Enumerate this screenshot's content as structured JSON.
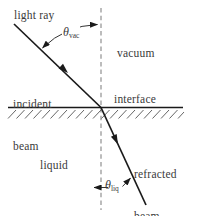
{
  "diagram": {
    "title_hint": "light refraction at vacuum-liquid interface",
    "labels": {
      "light_ray": "light ray",
      "vacuum": "vacuum",
      "incident_line1": "incident",
      "incident_line2": "beam",
      "interface": "interface",
      "refracted_line1": "refracted",
      "refracted_line2": "beam",
      "liquid": "liquid",
      "theta": "θ",
      "theta_vac_sub": "vac",
      "theta_liq_sub": "liq"
    },
    "colors": {
      "background": "#ffffff",
      "beam_line": "#1a1a1a",
      "interface_line": "#1a1a1a",
      "hatch_line": "#555555",
      "dashed_normal": "#909090",
      "annotation_line": "#333333",
      "text": "#3a3a3a"
    }
  }
}
